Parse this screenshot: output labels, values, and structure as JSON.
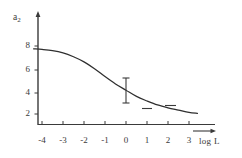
{
  "figure": {
    "background_color": "#ffffff",
    "ink_color": "#3a3a3a",
    "curve_color": "#2f2f2f"
  },
  "chart_data": {
    "type": "line",
    "title": "",
    "subtitle": "",
    "xlabel": "log L",
    "ylabel": "a2",
    "ylabel_display": "a",
    "ylabel_subscript": "2",
    "xlim": [
      -4.4,
      3.9
    ],
    "ylim": [
      0,
      9
    ],
    "grid": false,
    "legend": null,
    "x_ticks": [
      -4,
      -3,
      -2,
      -1,
      0,
      1,
      2,
      3
    ],
    "x_tick_labels": [
      "-4",
      "-3",
      "-2",
      "-1",
      "0",
      "1",
      "2",
      "3"
    ],
    "y_ticks": [
      2,
      4,
      6,
      8
    ],
    "y_tick_labels": [
      "2",
      "4",
      "6",
      "8"
    ],
    "x_axis_arrow": true,
    "y_axis_arrow": true,
    "series": [
      {
        "name": "sigmoid-curve",
        "type": "line",
        "x": [
          -4.4,
          -4.0,
          -3.5,
          -3.0,
          -2.5,
          -2.0,
          -1.5,
          -1.0,
          -0.5,
          0.0,
          0.5,
          1.0,
          1.5,
          2.0,
          2.5,
          3.0,
          3.4
        ],
        "values": [
          7.75,
          7.7,
          7.6,
          7.4,
          7.05,
          6.6,
          6.0,
          5.3,
          4.65,
          4.1,
          3.55,
          3.15,
          2.8,
          2.55,
          2.35,
          2.15,
          2.05
        ]
      }
    ],
    "error_bars": [
      {
        "name": "error-bar-at-zero",
        "x": 0.0,
        "y": 4.1,
        "y_low": 3.2,
        "y_high": 5.3,
        "caps": true
      }
    ],
    "markers": [
      {
        "name": "dash-marker-1",
        "x": 1.0,
        "y": 2.6,
        "style": "horizontal-dash"
      },
      {
        "name": "dash-marker-2",
        "x": 2.1,
        "y": 2.85,
        "style": "horizontal-dash"
      }
    ],
    "annotations": []
  }
}
